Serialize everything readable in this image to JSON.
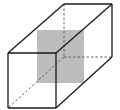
{
  "diagram": {
    "type": "3d-rectangular-prism-with-cross-section",
    "colors": {
      "background": "#ffffff",
      "edge": "#1a1a1a",
      "hidden_edge": "#555555",
      "cross_section_fill": "#bdbdbd"
    },
    "vertices": {
      "front_top_left": [
        8,
        53
      ],
      "front_top_right": [
        56,
        53
      ],
      "front_bottom_right": [
        56,
        108
      ],
      "front_bottom_left": [
        8,
        108
      ],
      "back_top_left": [
        64,
        4
      ],
      "back_top_right": [
        112,
        4
      ],
      "back_bottom_right": [
        112,
        57
      ],
      "back_bottom_left": [
        64,
        57
      ]
    },
    "cross_section": {
      "x": 37,
      "y": 30,
      "width": 47,
      "height": 53
    }
  }
}
